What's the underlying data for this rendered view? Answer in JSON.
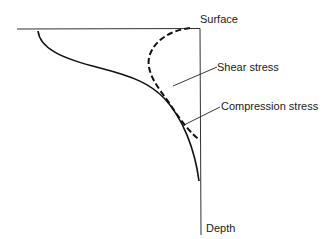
{
  "diagram": {
    "labels": {
      "surface": "Surface",
      "depth": "Depth",
      "shear": "Shear stress",
      "compression": "Compression stress"
    },
    "colors": {
      "line": "#1a1a1a",
      "background": "#ffffff"
    }
  }
}
